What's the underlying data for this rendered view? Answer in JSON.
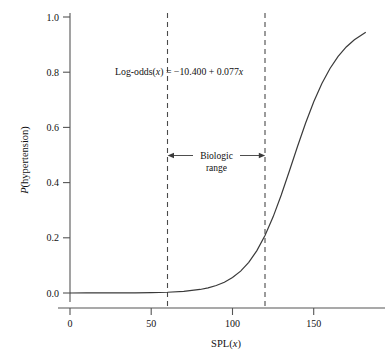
{
  "chart_data": {
    "type": "line",
    "title": "",
    "xlabel": "SPL(x)",
    "ylabel": "P(hypertension)",
    "xlim": [
      0,
      192
    ],
    "ylim": [
      0.0,
      1.0
    ],
    "grid": false,
    "legend": null,
    "model": {
      "form": "logistic",
      "equation_text": "Log-odds(x) = −10.400 + 0.077x",
      "equation_prefix": "Log-odds(",
      "equation_var": "x",
      "equation_middle": ") = −10.400 + 0.077",
      "equation_suffix": "x",
      "intercept": -10.4,
      "slope": 0.077
    },
    "x_ticks": [
      0,
      50,
      100,
      150
    ],
    "x_tick_labels": [
      "0",
      "50",
      "100",
      "150"
    ],
    "y_ticks": [
      0.0,
      0.2,
      0.4,
      0.6,
      0.8,
      1.0
    ],
    "y_tick_labels": [
      "0.0",
      "0.2",
      "0.4",
      "0.6",
      "0.8",
      "1.0"
    ],
    "series": [
      {
        "name": "P(hypertension)",
        "x": [
          0,
          10,
          20,
          30,
          40,
          50,
          60,
          70,
          80,
          85,
          90,
          95,
          100,
          105,
          110,
          115,
          120,
          125,
          130,
          135,
          140,
          145,
          150,
          155,
          160,
          165,
          170,
          175,
          182
        ],
        "values": [
          0.0,
          0.0001,
          0.0001,
          0.0003,
          0.0006,
          0.0013,
          0.0028,
          0.006,
          0.0128,
          0.0186,
          0.027,
          0.039,
          0.0559,
          0.0793,
          0.1112,
          0.1535,
          0.2082,
          0.2759,
          0.355,
          0.4418,
          0.5307,
          0.616,
          0.693,
          0.7591,
          0.8136,
          0.8572,
          0.8914,
          0.9177,
          0.9449
        ]
      }
    ],
    "reference_lines": [
      {
        "name": "biologic-range-lower",
        "x": 60,
        "style": "dashed"
      },
      {
        "name": "biologic-range-upper",
        "x": 120,
        "style": "dashed"
      }
    ],
    "annotations": [
      {
        "name": "biologic-range",
        "line1": "Biologic",
        "line2": "range",
        "x_from": 60,
        "x_to": 120,
        "y": 0.5,
        "arrows": "both-outward"
      }
    ],
    "colors": {
      "curve": "#3a3a3a",
      "axis": "#555555",
      "dashed": "#4a4a4a",
      "text": "#111111"
    }
  }
}
